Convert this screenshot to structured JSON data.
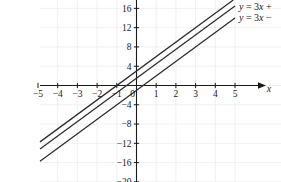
{
  "chart_data": {
    "type": "line",
    "title": "",
    "xlabel": "x",
    "ylabel": "",
    "xlim": [
      -5.6,
      5.6
    ],
    "ylim": [
      -20.5,
      17.5
    ],
    "grid": true,
    "legend_position": "top-right (inline labels at line ends, clipped at image edge)",
    "x_ticks": [
      -5,
      -4,
      -3,
      -2,
      -1,
      1,
      2,
      3,
      4,
      5
    ],
    "x_tick_labels": [
      "-5",
      "-4",
      "-3",
      "-2",
      "-1",
      "1",
      "2",
      "3",
      "4",
      "5"
    ],
    "y_ticks": [
      16,
      12,
      8,
      4,
      -4,
      -8,
      -12,
      -16,
      -20
    ],
    "y_tick_labels": [
      "16",
      "12",
      "8",
      "4",
      "-4",
      "-8",
      "-12",
      "-16",
      "-20"
    ],
    "origin_label": "0",
    "series": [
      {
        "name": "top-line",
        "slope": 3,
        "intercept": 3,
        "label": "",
        "x": [
          -5,
          5
        ],
        "values": [
          -12,
          18
        ]
      },
      {
        "name": "middle-line",
        "slope": 3,
        "intercept": 1.5,
        "label": "y = 3x +",
        "x": [
          -5,
          5
        ],
        "values": [
          -13.5,
          16.5
        ]
      },
      {
        "name": "bottom-line",
        "slope": 3,
        "intercept": -1,
        "label": "y = 3x −",
        "x": [
          -5,
          5
        ],
        "values": [
          -16,
          14
        ]
      }
    ]
  },
  "labels": {
    "x_axis_name": "x",
    "equation_top": "y = 3x +",
    "equation_bottom": "y = 3x −",
    "eq_y": "y",
    "eq_eq": " = 3",
    "eq_var": "x",
    "eq_plus": " +",
    "eq_minus": " −"
  },
  "colors": {
    "line": "#2b2b2b",
    "axis": "#1a1a1a",
    "grid": "#ececec",
    "background": "#ffffff"
  }
}
